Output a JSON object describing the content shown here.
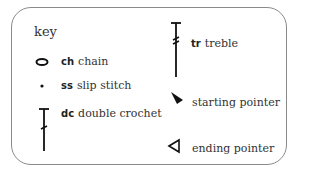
{
  "key": {
    "title": "key",
    "items": [
      {
        "abbr": "ch",
        "label": "chain",
        "icon": "chain-oval-icon"
      },
      {
        "abbr": "ss",
        "label": "slip stitch",
        "icon": "slip-stitch-dot-icon"
      },
      {
        "abbr": "dc",
        "label": "double crochet",
        "icon": "double-crochet-icon"
      },
      {
        "abbr": "tr",
        "label": "treble",
        "icon": "treble-icon"
      },
      {
        "abbr": "",
        "label": "starting pointer",
        "icon": "starting-pointer-icon"
      },
      {
        "abbr": "",
        "label": "ending pointer",
        "icon": "ending-pointer-icon"
      }
    ]
  }
}
